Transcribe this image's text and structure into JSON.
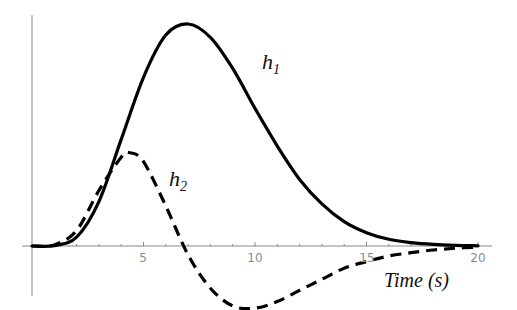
{
  "chart_data": {
    "type": "line",
    "title": "",
    "xlabel": "Time (s)",
    "ylabel": "",
    "xlim": [
      0,
      20
    ],
    "ylim": [
      -0.26,
      1.0
    ],
    "grid": false,
    "legend": "inline labels",
    "x_ticks": [
      5,
      10,
      15,
      20
    ],
    "series": [
      {
        "name": "h1",
        "label_main": "h",
        "label_sub": "1",
        "style": "solid",
        "x": [
          0,
          1,
          2,
          3,
          4,
          5,
          6,
          7,
          8,
          9,
          10,
          11,
          12,
          13,
          14,
          15,
          16,
          17,
          18,
          19,
          20
        ],
        "y": [
          0,
          0.002,
          0.04,
          0.2,
          0.48,
          0.76,
          0.95,
          1.0,
          0.94,
          0.8,
          0.62,
          0.45,
          0.3,
          0.19,
          0.11,
          0.06,
          0.03,
          0.015,
          0.007,
          0.003,
          0.001
        ]
      },
      {
        "name": "h2",
        "label_main": "h",
        "label_sub": "2",
        "style": "dashed",
        "x": [
          0,
          1,
          2,
          3,
          4,
          4.4,
          5,
          6,
          7,
          8,
          9,
          10,
          11,
          12,
          13,
          14,
          15,
          16,
          17,
          18,
          19,
          20
        ],
        "y": [
          0,
          0.005,
          0.07,
          0.25,
          0.4,
          0.42,
          0.38,
          0.18,
          -0.04,
          -0.19,
          -0.27,
          -0.28,
          -0.25,
          -0.2,
          -0.15,
          -0.1,
          -0.07,
          -0.045,
          -0.03,
          -0.018,
          -0.01,
          -0.005
        ]
      }
    ]
  },
  "labels": {
    "h1_main": "h",
    "h1_sub": "1",
    "h2_main": "h",
    "h2_sub": "2",
    "x_axis_title": "Time (s)",
    "tick_5": "5",
    "tick_10": "10",
    "tick_15": "15",
    "tick_20": "20"
  }
}
